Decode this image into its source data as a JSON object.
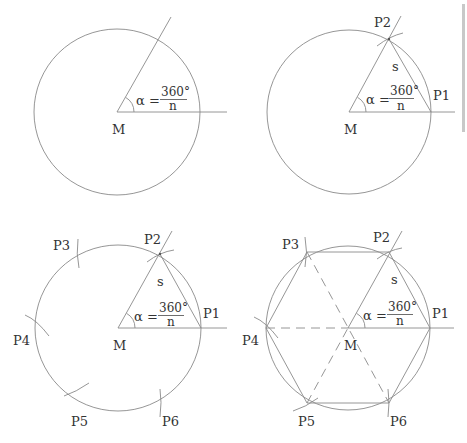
{
  "figure": {
    "formula": {
      "alpha": "α =",
      "numerator": "360°",
      "denominator": "n"
    },
    "center_label": "M",
    "side_label": "s",
    "points": [
      "P1",
      "P2",
      "P3",
      "P4",
      "P5",
      "P6"
    ],
    "colors": {
      "line": "#8a8a8a",
      "text": "#333333",
      "background": "#ffffff"
    }
  },
  "panels": [
    {
      "step": 1,
      "labels": {
        "center": "M"
      }
    },
    {
      "step": 2,
      "labels": {
        "center": "M",
        "side": "s",
        "p1": "P1",
        "p2": "P2"
      }
    },
    {
      "step": 3,
      "labels": {
        "center": "M",
        "side": "s",
        "p1": "P1",
        "p2": "P2",
        "p3": "P3",
        "p4": "P4",
        "p5": "P5",
        "p6": "P6"
      }
    },
    {
      "step": 4,
      "labels": {
        "center": "M",
        "side": "s",
        "p1": "P1",
        "p2": "P2",
        "p3": "P3",
        "p4": "P4",
        "p5": "P5",
        "p6": "P6"
      }
    }
  ]
}
